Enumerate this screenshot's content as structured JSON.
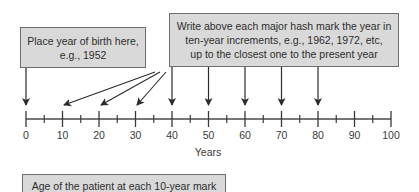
{
  "boxes": {
    "birth": {
      "lines": [
        "Place year of birth here,",
        "e.g., 1952"
      ]
    },
    "years": {
      "lines": [
        "Write above each major hash mark the year in",
        "ten-year increments, e.g., 1962, 1972, etc,",
        "up to the closest one to the present year"
      ]
    },
    "age": {
      "lines": [
        "Age of the patient at each 10-year mark"
      ]
    }
  },
  "axis": {
    "title": "Years",
    "major_ticks": [
      "0",
      "10",
      "20",
      "30",
      "40",
      "50",
      "60",
      "70",
      "80",
      "90",
      "100"
    ],
    "min": 0,
    "max": 100,
    "major_step": 10,
    "minor_step": 5
  },
  "arrows": {
    "from_birth_box_to": [
      "0"
    ],
    "fan_from_years_box_to": [
      "10",
      "20",
      "30"
    ],
    "straight_from_years_box_to": [
      "40",
      "50",
      "60",
      "70",
      "80"
    ]
  },
  "colors": {
    "box_fill": "#d9d9d9",
    "box_border": "#6e6e6e",
    "line": "#2b2b2b",
    "text": "#2e2e2e"
  }
}
